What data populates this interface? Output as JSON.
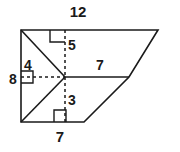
{
  "diagram": {
    "type": "geometry-figure",
    "shape_name": "quadrilateral-with-interior-segments",
    "stroke_color": "#1a1a1a",
    "background_color": "#ffffff",
    "labels": {
      "top": "12",
      "upper_vertical": "5",
      "left_upper": "4",
      "left_side": "8",
      "middle_horizontal": "7",
      "lower_vertical": "3",
      "bottom": "7"
    },
    "label_positions": {
      "top": {
        "x": 78,
        "y": 13
      },
      "upper_vertical": {
        "x": 72,
        "y": 46
      },
      "left_upper": {
        "x": 28,
        "y": 66
      },
      "left_side": {
        "x": 13,
        "y": 80
      },
      "middle_horizontal": {
        "x": 100,
        "y": 66
      },
      "lower_vertical": {
        "x": 72,
        "y": 101
      },
      "bottom": {
        "x": 60,
        "y": 138
      }
    },
    "vertices": {
      "top_left": {
        "x": 21,
        "y": 30
      },
      "top_right": {
        "x": 158,
        "y": 30
      },
      "bottom_left": {
        "x": 21,
        "y": 122
      },
      "bottom_mid": {
        "x": 84,
        "y": 122
      },
      "right_mid": {
        "x": 129,
        "y": 77
      },
      "center": {
        "x": 65,
        "y": 77
      }
    },
    "solid_outline_path": "M 21 30 L 158 30 L 129 77 L 84 122 L 21 122 Z",
    "interior_solid_segments": [
      {
        "name": "diagonal-top-left-to-center",
        "x1": 21,
        "y1": 30,
        "x2": 65,
        "y2": 77
      },
      {
        "name": "diagonal-bottom-left-to-center",
        "x1": 21,
        "y1": 122,
        "x2": 65,
        "y2": 77
      },
      {
        "name": "horizontal-center-to-right",
        "x1": 65,
        "y1": 77,
        "x2": 129,
        "y2": 77
      }
    ],
    "interior_dashed_segments": [
      {
        "name": "vertical-up-from-center",
        "x1": 65,
        "y1": 77,
        "x2": 65,
        "y2": 30
      },
      {
        "name": "vertical-down-from-center",
        "x1": 65,
        "y1": 77,
        "x2": 65,
        "y2": 122
      },
      {
        "name": "horizontal-left-from-center",
        "x1": 65,
        "y1": 77,
        "x2": 21,
        "y2": 77
      }
    ],
    "right_angle_marks": [
      {
        "name": "right-angle-top",
        "path": "M 50 30 L 50 42 L 65 42"
      },
      {
        "name": "right-angle-left",
        "path": "M 21 71 L 33 71 L 33 83 L 21 83"
      },
      {
        "name": "right-angle-bottom",
        "path": "M 54 122 L 54 110 L 66 110 L 66 122"
      }
    ]
  }
}
